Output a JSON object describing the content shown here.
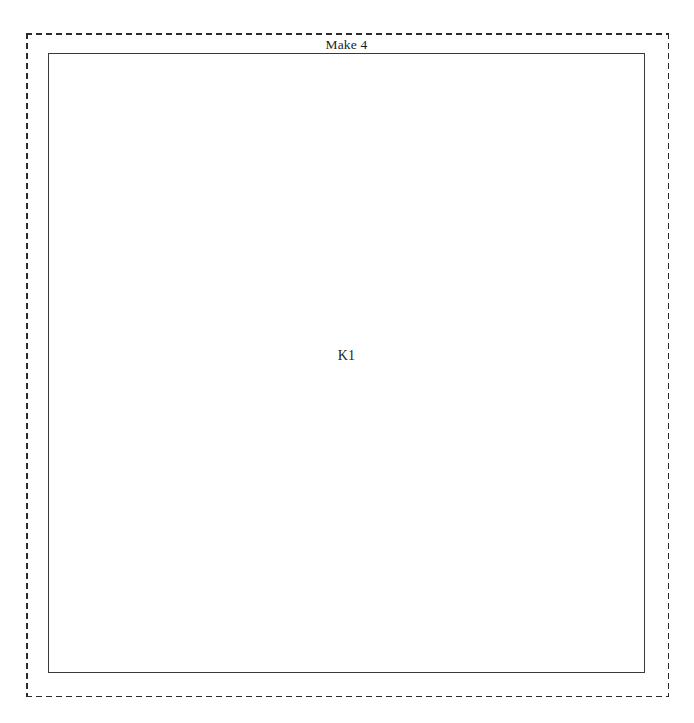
{
  "document": {
    "background_color": "#ffffff",
    "width": 694,
    "height": 723
  },
  "drawing": {
    "title": "Make 4",
    "outer_boundary": {
      "name": "cut-sheet-boundary",
      "style": "dashed",
      "color": "#2b2b2b"
    },
    "part": {
      "label": "K1",
      "style": "solid",
      "color": "#3a3a3a",
      "fill": "#ffffff"
    }
  }
}
